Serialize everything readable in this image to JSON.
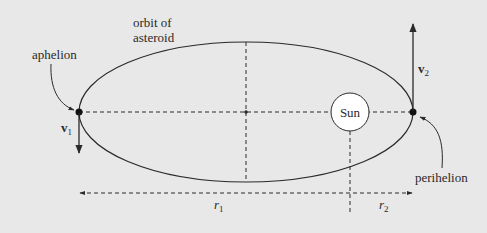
{
  "diagram": {
    "background_color": "#e8e8e8",
    "line_color": "#2a2a2a",
    "labels": {
      "orbit_line1": "orbit of",
      "orbit_line2": "asteroid",
      "aphelion": "aphelion",
      "perihelion": "perihelion",
      "sun": "Sun",
      "v1_base": "v",
      "v1_sub": "1",
      "v2_base": "v",
      "v2_sub": "2",
      "r1_base": "r",
      "r1_sub": "1",
      "r2_base": "r",
      "r2_sub": "2"
    },
    "geometry": {
      "ellipse_center": [
        246,
        112
      ],
      "ellipse_rx": 167,
      "ellipse_ry": 70,
      "sun_center": [
        350,
        112
      ],
      "sun_radius": 19,
      "aphelion_point": [
        79,
        112
      ],
      "perihelion_point": [
        413,
        112
      ]
    }
  }
}
